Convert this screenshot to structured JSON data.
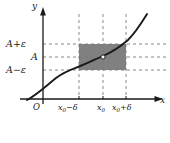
{
  "figure": {
    "kind": "epsilon-delta-limit-diagram",
    "background_color": "#ffffff",
    "axes": {
      "y_axis_label": "y",
      "x_axis_label": "x",
      "origin_label": "O",
      "axis_color": "#1a1a1a"
    },
    "y_ticks": [
      {
        "id": "a-plus-eps",
        "label_parts": {
          "base": "A",
          "op": "+",
          "sym": "ε"
        },
        "text": "A + ε",
        "y_px": 44
      },
      {
        "id": "a",
        "label_parts": {
          "base": "A",
          "op": "",
          "sym": ""
        },
        "text": "A",
        "y_px": 57
      },
      {
        "id": "a-minus-eps",
        "label_parts": {
          "base": "A",
          "op": "−",
          "sym": "ε"
        },
        "text": "A − ε",
        "y_px": 70
      }
    ],
    "x_ticks": [
      {
        "id": "x0-minus-delta",
        "label_parts": {
          "base": "x",
          "sub": "0",
          "op": "−",
          "sym": "δ"
        },
        "text": "x₀ − δ",
        "x_px": 79
      },
      {
        "id": "x0",
        "label_parts": {
          "base": "x",
          "sub": "0",
          "op": "",
          "sym": ""
        },
        "text": "x₀",
        "x_px": 103
      },
      {
        "id": "x0-plus-delta",
        "label_parts": {
          "base": "x",
          "sub": "0",
          "op": "+",
          "sym": "δ"
        },
        "text": "x₀ + δ",
        "x_px": 126
      }
    ],
    "shaded_region": {
      "fill_color": "#808080",
      "x_from": 79,
      "x_to": 126,
      "y_top": 44,
      "y_bottom": 70
    },
    "dashed_lines": {
      "color": "#7a7a7a",
      "dash": "3 3"
    },
    "curve": {
      "color": "#1a1a1a",
      "stroke_width": 1.9,
      "description": "increasing S-shaped curve",
      "path": "M 27 100 C 38 94 46 86 56 78 C 64 72 70 70 78 67 C 88 63 96 59 103 56 C 112 52 120 47 128 40 C 136 32 142 22 147 14"
    },
    "marked_point": {
      "x_px": 103,
      "y_px": 57,
      "style": "open-circle",
      "fill": "#ffffff",
      "stroke": "#1a1a1a",
      "radius": 2.1
    }
  }
}
